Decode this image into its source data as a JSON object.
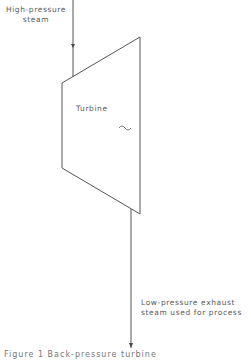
{
  "diagram": {
    "inlet_label_line1": "High-pressure",
    "inlet_label_line2": "steam",
    "turbine_label": "Turbine",
    "generator_symbol": "~",
    "outlet_label_line1": "Low-pressure exhaust",
    "outlet_label_line2": "steam used for process",
    "caption": "Figure 1   Back-pressure turbine",
    "line_color": "#555555"
  }
}
